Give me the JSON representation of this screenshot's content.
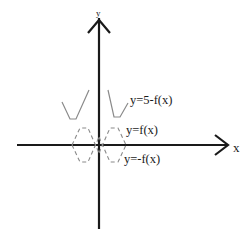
{
  "diagram": {
    "axes": {
      "x_label": "x",
      "y_label": "y"
    },
    "curves": [
      {
        "name": "shifted-reflected",
        "label": "y=5-f(x)",
        "style": "solid",
        "color": "#8a8a8a"
      },
      {
        "name": "original",
        "label": "y=f(x)",
        "style": "dashed",
        "color": "#8a8a8a"
      },
      {
        "name": "reflected",
        "label": "y=-f(x)",
        "style": "dashed",
        "color": "#8a8a8a"
      }
    ],
    "axis_color": "#1a1a1a",
    "background": "#ffffff"
  }
}
